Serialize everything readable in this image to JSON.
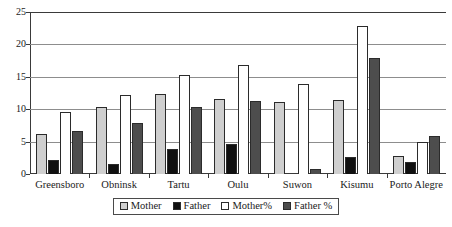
{
  "chart_data": {
    "type": "bar",
    "title": "",
    "subtitle": "",
    "xlabel": "",
    "ylabel": "",
    "ylim": [
      0,
      25
    ],
    "ytick_labels": [
      "0",
      "5",
      "10",
      "15",
      "20",
      "25"
    ],
    "ytick_values": [
      0,
      5,
      10,
      15,
      20,
      25
    ],
    "grid": true,
    "legend_position": "bottom",
    "categories": [
      "Greensboro",
      "Obninsk",
      "Tartu",
      "Oulu",
      "Suwon",
      "Kisumu",
      "Porto Alegre"
    ],
    "series": [
      {
        "name": "Mother",
        "color": "#cfcfcf",
        "values": [
          6.2,
          10.3,
          12.3,
          11.5,
          11.1,
          11.4,
          2.8
        ]
      },
      {
        "name": "Father",
        "color": "#101010",
        "values": [
          2.1,
          1.5,
          3.9,
          4.6,
          0.0,
          2.6,
          1.9
        ]
      },
      {
        "name": "Mother%",
        "color": "#ffffff",
        "values": [
          9.6,
          12.2,
          15.3,
          16.8,
          13.9,
          22.9,
          4.9
        ]
      },
      {
        "name": "Father %",
        "color": "#4d4d4d",
        "values": [
          6.6,
          7.9,
          10.4,
          11.2,
          0.8,
          17.9,
          5.9
        ]
      }
    ]
  },
  "legend": {
    "items": [
      {
        "label": "Mother",
        "swatch": "s-mother"
      },
      {
        "label": "Father",
        "swatch": "s-father"
      },
      {
        "label": "Mother%",
        "swatch": "s-motherpct"
      },
      {
        "label": "Father %",
        "swatch": "s-fatherpct"
      }
    ]
  }
}
